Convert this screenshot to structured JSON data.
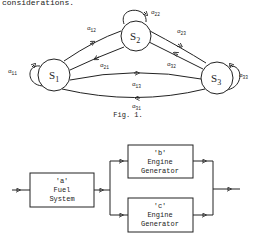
{
  "top_fragment": "considerations.",
  "state_diagram": {
    "states": [
      {
        "id": "S1",
        "label": "S",
        "sub": "1"
      },
      {
        "id": "S2",
        "label": "S",
        "sub": "2"
      },
      {
        "id": "S3",
        "label": "S",
        "sub": "3"
      }
    ],
    "transitions": [
      {
        "label": "α",
        "sub": "11"
      },
      {
        "label": "α",
        "sub": "12"
      },
      {
        "label": "α",
        "sub": "21"
      },
      {
        "label": "α",
        "sub": "22"
      },
      {
        "label": "α",
        "sub": "23"
      },
      {
        "label": "α",
        "sub": "32"
      },
      {
        "label": "α",
        "sub": "33"
      },
      {
        "label": "α",
        "sub": "13"
      },
      {
        "label": "α",
        "sub": "31"
      }
    ],
    "caption": "Fig. 1."
  },
  "block_diagram": {
    "blocks": [
      {
        "id": "a",
        "tag": "'a'",
        "line1": "Fuel",
        "line2": "System"
      },
      {
        "id": "b",
        "tag": "'b'",
        "line1": "Engine",
        "line2": "Generator"
      },
      {
        "id": "c",
        "tag": "'c'",
        "line1": "Engine",
        "line2": "Generator"
      }
    ]
  },
  "colors": {
    "ink": "#222222",
    "background": "#ffffff"
  }
}
